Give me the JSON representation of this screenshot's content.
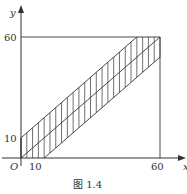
{
  "figure": {
    "caption": "图 1.4",
    "x_axis_label": "x",
    "y_axis_label": "y",
    "origin_label": "O",
    "x_ticks": [
      {
        "value": 10,
        "label": "10"
      },
      {
        "value": 60,
        "label": "60"
      }
    ],
    "y_ticks": [
      {
        "value": 10,
        "label": "10"
      },
      {
        "value": 60,
        "label": "60"
      }
    ],
    "square_max": 60,
    "band": {
      "upper_line": "y = x + 10",
      "middle_line": "y = x",
      "lower_line": "y = x - 10",
      "offset": 10,
      "hatch_step": 2.5
    },
    "colors": {
      "stroke": "#333333",
      "background": "#ffffff"
    }
  }
}
